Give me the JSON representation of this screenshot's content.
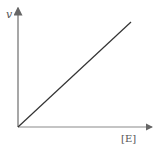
{
  "chart_data": {
    "type": "line",
    "title": "",
    "xlabel": "[E]",
    "ylabel": "v",
    "x": [
      0,
      1
    ],
    "series": [
      {
        "name": "v vs [E]",
        "values": [
          0,
          1
        ]
      }
    ],
    "xlim": [
      0,
      1
    ],
    "ylim": [
      0,
      1
    ],
    "grid": false,
    "legend": "none",
    "axis_arrows": true,
    "line_color": "#333333",
    "axis_color": "#888888"
  }
}
